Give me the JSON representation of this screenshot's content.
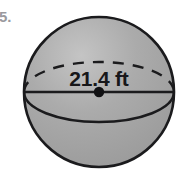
{
  "figure": {
    "kind": "sphere-diagram",
    "background_color": "#ffffff",
    "canvas": {
      "width": 187,
      "height": 186
    }
  },
  "problem_number": {
    "label": "5.",
    "visible_partial": true,
    "color": "#9a9a9e"
  },
  "sphere": {
    "name": "sphere-shape",
    "center_x": 99,
    "center_y": 92,
    "radius": 75,
    "fill_color": "#a8a8a8",
    "outline_color": "#1b1b1d",
    "outline_width": 2.6
  },
  "equator": {
    "name": "equator-ellipse",
    "radius_x": 75,
    "radius_y": 30,
    "back_arc_style": "dashed",
    "front_arc_style": "solid",
    "dash_pattern": "11 9",
    "stroke_color": "#1b1b1d",
    "stroke_width": 2.4
  },
  "diameter_line": {
    "name": "diameter-line",
    "orientation": "horizontal",
    "stroke_color": "#1b1b1d",
    "stroke_width": 2.4,
    "x_start": 24,
    "x_end": 174,
    "y": 92
  },
  "center_point": {
    "name": "center-dot",
    "x": 99,
    "y": 92,
    "radius": 5.2,
    "color": "#111113"
  },
  "dimension_label": {
    "name": "diameter-measure",
    "value": "21.4",
    "unit": "ft",
    "text": "21.4 ft",
    "measures": "diameter",
    "x": 99,
    "y": 86,
    "color": "#17171a"
  }
}
